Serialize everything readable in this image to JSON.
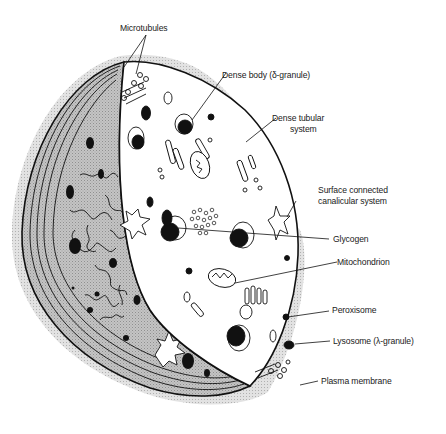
{
  "diagram": {
    "labels": [
      {
        "id": "microtubules",
        "text": "Microtubules"
      },
      {
        "id": "dense-body",
        "text": "Dense body (δ-granule)"
      },
      {
        "id": "dense-tubular-line1",
        "text": "Dense tubular"
      },
      {
        "id": "dense-tubular-line2",
        "text": "system"
      },
      {
        "id": "sccs-line1",
        "text": "Surface connected"
      },
      {
        "id": "sccs-line2",
        "text": "canalicular system"
      },
      {
        "id": "glycogen",
        "text": "Glycogen"
      },
      {
        "id": "mitochondrion",
        "text": "Mitochondrion"
      },
      {
        "id": "peroxisome",
        "text": "Peroxisome"
      },
      {
        "id": "lysosome",
        "text": "Lysosome (λ-granule)"
      },
      {
        "id": "plasma-membrane",
        "text": "Plasma membrane"
      }
    ],
    "colors": {
      "outline": "#111111",
      "cut_face": "#ffffff",
      "shell_shade": "#b9b9b9",
      "halo": "#d6d6d6",
      "label_text": "#1a1a1a"
    }
  }
}
